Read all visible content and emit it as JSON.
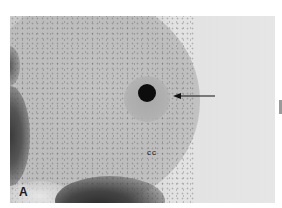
{
  "figure": {
    "panel_label": "A",
    "region_label": "cc",
    "annotation": "arrow pointing left at dark oocyte",
    "colors": {
      "background": "#ffffff",
      "field": "#e4e4e4",
      "cumulus": "#bdbdbd",
      "oocyte": "#0d0d0d",
      "shadow": "#2a2a2a"
    }
  }
}
